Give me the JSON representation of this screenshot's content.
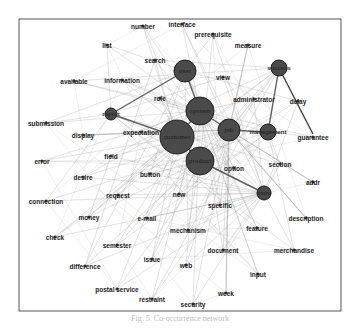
{
  "figure": {
    "caption": "Fig. 5. Co-occurrence network"
  },
  "diagram": {
    "type": "network graph",
    "frame": {
      "x": 19,
      "y": 19,
      "width": 145,
      "height": 92
    },
    "hub_nodes": [
      {
        "id": "customer",
        "label": "customer",
        "x": 177,
        "y": 137,
        "r": 17
      },
      {
        "id": "system",
        "label": "system",
        "x": 200,
        "y": 111,
        "r": 14
      },
      {
        "id": "product",
        "label": "product",
        "x": 200,
        "y": 161,
        "r": 14
      },
      {
        "id": "user",
        "label": "user",
        "x": 185,
        "y": 71,
        "r": 11
      },
      {
        "id": "job",
        "label": "job",
        "x": 229,
        "y": 130,
        "r": 11
      },
      {
        "id": "success",
        "label": "success",
        "x": 279,
        "y": 68,
        "r": 8
      },
      {
        "id": "management",
        "label": "management",
        "x": 268,
        "y": 132,
        "r": 8
      },
      {
        "id": "store",
        "label": "store",
        "x": 264,
        "y": 193,
        "r": 7
      },
      {
        "id": "report",
        "label": "report",
        "x": 111,
        "y": 114,
        "r": 6
      }
    ],
    "small_nodes": [
      {
        "label": "number",
        "x": 143,
        "y": 26
      },
      {
        "label": "interface",
        "x": 182,
        "y": 24
      },
      {
        "label": "prerequisite",
        "x": 213,
        "y": 34
      },
      {
        "label": "list",
        "x": 107,
        "y": 45
      },
      {
        "label": "measure",
        "x": 248,
        "y": 45
      },
      {
        "label": "search",
        "x": 155,
        "y": 60
      },
      {
        "label": "available",
        "x": 74,
        "y": 81
      },
      {
        "label": "information",
        "x": 122,
        "y": 80
      },
      {
        "label": "view",
        "x": 223,
        "y": 77
      },
      {
        "label": "role",
        "x": 160,
        "y": 98
      },
      {
        "label": "administrator",
        "x": 254,
        "y": 99
      },
      {
        "label": "delay",
        "x": 298,
        "y": 101
      },
      {
        "label": "submission",
        "x": 46,
        "y": 123
      },
      {
        "label": "display",
        "x": 83,
        "y": 135
      },
      {
        "label": "expectation",
        "x": 141,
        "y": 132
      },
      {
        "label": "guarantee",
        "x": 313,
        "y": 137
      },
      {
        "label": "field",
        "x": 111,
        "y": 156
      },
      {
        "label": "section",
        "x": 280,
        "y": 164
      },
      {
        "label": "error",
        "x": 42,
        "y": 161
      },
      {
        "label": "desire",
        "x": 83,
        "y": 177
      },
      {
        "label": "button",
        "x": 150,
        "y": 174
      },
      {
        "label": "option",
        "x": 234,
        "y": 168
      },
      {
        "label": "addr",
        "x": 313,
        "y": 182
      },
      {
        "label": "request",
        "x": 118,
        "y": 195
      },
      {
        "label": "new",
        "x": 179,
        "y": 194
      },
      {
        "label": "specific",
        "x": 220,
        "y": 205
      },
      {
        "label": "connection",
        "x": 46,
        "y": 201
      },
      {
        "label": "money",
        "x": 89,
        "y": 217
      },
      {
        "label": "e-mail",
        "x": 147,
        "y": 218
      },
      {
        "label": "mechanism",
        "x": 188,
        "y": 230
      },
      {
        "label": "feature",
        "x": 257,
        "y": 228
      },
      {
        "label": "description",
        "x": 306,
        "y": 218
      },
      {
        "label": "check",
        "x": 55,
        "y": 237
      },
      {
        "label": "semester",
        "x": 117,
        "y": 245
      },
      {
        "label": "document",
        "x": 223,
        "y": 250
      },
      {
        "label": "merchandise",
        "x": 294,
        "y": 250
      },
      {
        "label": "issue",
        "x": 152,
        "y": 259
      },
      {
        "label": "web",
        "x": 186,
        "y": 265
      },
      {
        "label": "difference",
        "x": 85,
        "y": 266
      },
      {
        "label": "input",
        "x": 258,
        "y": 274
      },
      {
        "label": "week",
        "x": 226,
        "y": 293
      },
      {
        "label": "postal service",
        "x": 117,
        "y": 289
      },
      {
        "label": "restraint",
        "x": 152,
        "y": 299
      },
      {
        "label": "security",
        "x": 193,
        "y": 304
      }
    ],
    "colors": {
      "node_fill": "#4a4a4a",
      "node_stroke": "#1f1f1f",
      "edge": "#9a9a9a",
      "edge_strong": "#3b3b3b",
      "label": "#222222",
      "border": "#555555"
    }
  }
}
